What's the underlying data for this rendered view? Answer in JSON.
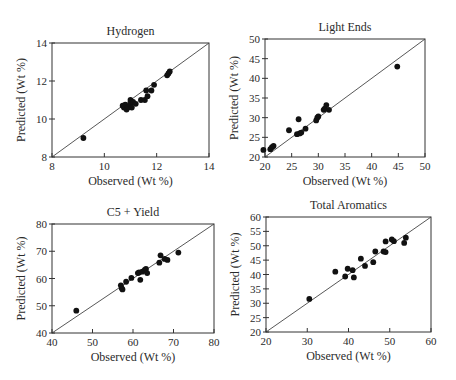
{
  "chart_data": [
    {
      "type": "scatter",
      "title": "Hydrogen",
      "xlabel": "Observed (Wt %)",
      "ylabel": "Predicted (Wt %)",
      "xlim": [
        8,
        14
      ],
      "ylim": [
        8,
        14
      ],
      "xticks": [
        8,
        10,
        12,
        14
      ],
      "yticks": [
        8,
        10,
        12,
        14
      ],
      "grid": false,
      "reference_line": "y = x",
      "frame": {
        "left": 52,
        "top": 43,
        "right": 209,
        "bottom": 157
      },
      "points": [
        [
          9.2,
          9.0
        ],
        [
          10.7,
          10.7
        ],
        [
          10.75,
          10.6
        ],
        [
          10.8,
          10.75
        ],
        [
          10.85,
          10.5
        ],
        [
          10.9,
          10.6
        ],
        [
          11.0,
          11.0
        ],
        [
          11.0,
          10.8
        ],
        [
          11.05,
          10.6
        ],
        [
          11.1,
          10.9
        ],
        [
          11.2,
          10.8
        ],
        [
          11.4,
          11.0
        ],
        [
          11.55,
          11.0
        ],
        [
          11.6,
          11.5
        ],
        [
          11.65,
          11.2
        ],
        [
          11.8,
          11.5
        ],
        [
          11.9,
          11.8
        ],
        [
          12.4,
          12.3
        ],
        [
          12.45,
          12.4
        ],
        [
          12.5,
          12.5
        ]
      ]
    },
    {
      "type": "scatter",
      "title": "Light Ends",
      "xlabel": "Observed (Wt %)",
      "ylabel": "Predicted (Wt %)",
      "xlim": [
        20,
        50
      ],
      "ylim": [
        20,
        50
      ],
      "xticks": [
        20,
        25,
        30,
        35,
        40,
        45,
        50
      ],
      "yticks": [
        20,
        25,
        30,
        35,
        40,
        45,
        50
      ],
      "grid": false,
      "reference_line": "y = x",
      "frame": {
        "left": 265,
        "top": 39,
        "right": 425,
        "bottom": 157
      },
      "points": [
        [
          19.7,
          21.8
        ],
        [
          21.0,
          22.0
        ],
        [
          21.3,
          22.5
        ],
        [
          21.6,
          22.8
        ],
        [
          24.5,
          26.8
        ],
        [
          26.0,
          25.8
        ],
        [
          26.3,
          29.6
        ],
        [
          26.5,
          26.0
        ],
        [
          26.8,
          26.2
        ],
        [
          27.6,
          27.2
        ],
        [
          29.6,
          29.3
        ],
        [
          29.8,
          30.0
        ],
        [
          30.0,
          30.3
        ],
        [
          31.0,
          32.0
        ],
        [
          31.2,
          32.3
        ],
        [
          31.5,
          33.2
        ],
        [
          32.0,
          32.0
        ],
        [
          44.8,
          43.0
        ]
      ]
    },
    {
      "type": "scatter",
      "title": "C5 + Yield",
      "xlabel": "Observed (Wt %)",
      "ylabel": "Predicted (Wt %)",
      "xlim": [
        40,
        80
      ],
      "ylim": [
        40,
        80
      ],
      "xticks": [
        40,
        50,
        60,
        70,
        80
      ],
      "yticks": [
        40,
        50,
        60,
        70,
        80
      ],
      "grid": false,
      "reference_line": "y = x",
      "frame": {
        "left": 52,
        "top": 224,
        "right": 214,
        "bottom": 333
      },
      "points": [
        [
          46.0,
          48.2
        ],
        [
          57.0,
          57.5
        ],
        [
          57.2,
          56.5
        ],
        [
          57.4,
          56.0
        ],
        [
          58.3,
          58.8
        ],
        [
          59.6,
          60.2
        ],
        [
          61.2,
          62.0
        ],
        [
          61.5,
          62.2
        ],
        [
          61.8,
          59.5
        ],
        [
          62.3,
          62.5
        ],
        [
          62.9,
          63.2
        ],
        [
          63.2,
          63.5
        ],
        [
          63.5,
          62.0
        ],
        [
          66.5,
          65.8
        ],
        [
          66.8,
          68.5
        ],
        [
          67.8,
          67.2
        ],
        [
          68.5,
          66.8
        ],
        [
          71.2,
          69.5
        ]
      ]
    },
    {
      "type": "scatter",
      "title": "Total Aromatics",
      "xlabel": "Observed (Wt %)",
      "ylabel": "Predicted (Wt %)",
      "xlim": [
        20,
        60
      ],
      "ylim": [
        20,
        60
      ],
      "xticks": [
        20,
        30,
        40,
        50,
        60
      ],
      "yticks": [
        20,
        25,
        30,
        35,
        40,
        45,
        50,
        55,
        60
      ],
      "grid": false,
      "reference_line": "y = x",
      "frame": {
        "left": 266,
        "top": 217,
        "right": 431,
        "bottom": 332
      },
      "points": [
        [
          30.5,
          31.5
        ],
        [
          36.8,
          41.0
        ],
        [
          39.2,
          39.3
        ],
        [
          39.8,
          42.0
        ],
        [
          41.0,
          41.5
        ],
        [
          41.3,
          39.0
        ],
        [
          43.0,
          45.5
        ],
        [
          44.0,
          43.0
        ],
        [
          46.0,
          44.3
        ],
        [
          46.5,
          48.0
        ],
        [
          48.5,
          48.0
        ],
        [
          49.0,
          47.8
        ],
        [
          49.0,
          51.5
        ],
        [
          50.5,
          52.2
        ],
        [
          51.0,
          51.6
        ],
        [
          53.5,
          51.0
        ],
        [
          53.9,
          52.8
        ]
      ]
    }
  ],
  "colors": {
    "marker": "#111111",
    "axis": "#333333",
    "reference_line": "#444444",
    "text": "#2a2a2a"
  }
}
